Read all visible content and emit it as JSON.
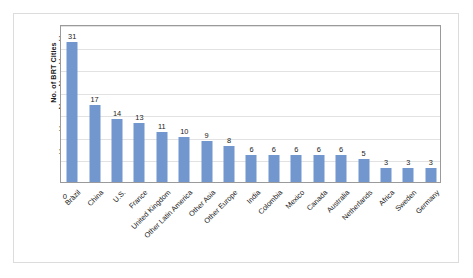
{
  "chart_data": {
    "type": "bar",
    "title": "",
    "xlabel": "",
    "ylabel": "No. of BRT Cities",
    "ylim": [
      0,
      35
    ],
    "ytick_labels": [
      "0",
      "5",
      "10",
      "15",
      "20",
      "25",
      "30",
      "35"
    ],
    "ytick_values": [
      0,
      5,
      10,
      15,
      20,
      25,
      30,
      35
    ],
    "grid": true,
    "legend": false,
    "bar_color": "#7296CE",
    "categories": [
      "Brazil",
      "China",
      "U.S.",
      "France",
      "United Kingdom",
      "Other Latin America",
      "Other Asia",
      "Other Europe",
      "India",
      "Colombia",
      "Mexico",
      "Canada",
      "Australia",
      "Netherlands",
      "Africa",
      "Sweden",
      "Germany"
    ],
    "values": [
      31,
      17,
      14,
      13,
      11,
      10,
      9,
      8,
      6,
      6,
      6,
      6,
      6,
      5,
      3,
      3,
      3
    ],
    "data_labels": [
      "31",
      "17",
      "14",
      "13",
      "11",
      "10",
      "9",
      "8",
      "6",
      "6",
      "6",
      "6",
      "6",
      "5",
      "3",
      "3",
      "3"
    ]
  },
  "colors": {
    "bar": "#7296CE",
    "gridline": "#E2E2E2",
    "plot_border": "#9A9A9A",
    "outer_border": "#DCDCDC",
    "text": "#1A1A1A"
  }
}
